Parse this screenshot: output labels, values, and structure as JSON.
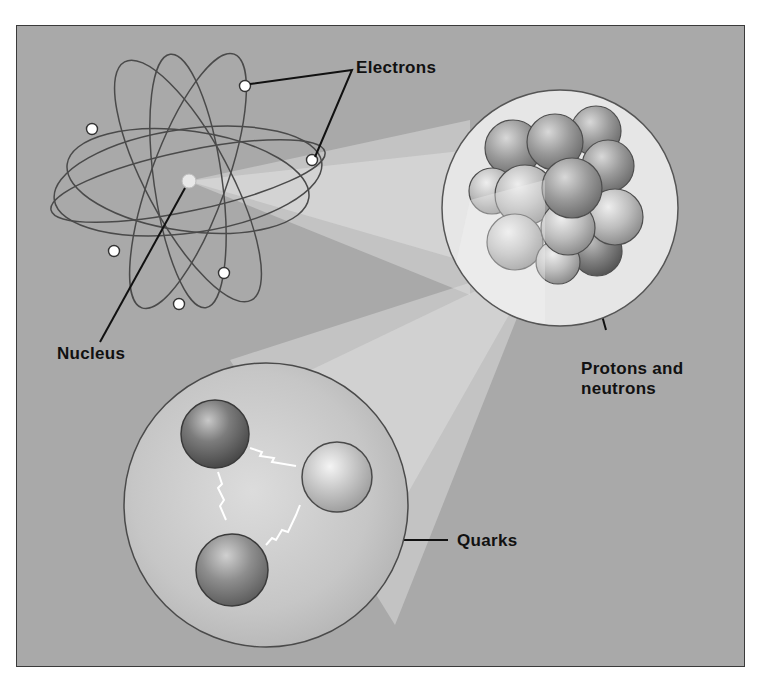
{
  "diagram": {
    "colors": {
      "background": "#a9a9a9",
      "frame": "#3a3a3a",
      "orbit": "#4a4a4a",
      "electron": "#ffffff",
      "beam": "#e4e4e4",
      "nucleus_disc": "#e6e6e6",
      "nucleon_disc": "#c4c4c4",
      "label_text": "#111111"
    },
    "labels": {
      "electrons": "Electrons",
      "nucleus": "Nucleus",
      "protons_neutrons_line1": "Protons and",
      "protons_neutrons_line2": "neutrons",
      "quarks": "Quarks"
    },
    "atom": {
      "center": [
        188,
        181
      ],
      "electron_count": 7,
      "orbit_count": 5
    },
    "nucleus_zoom": {
      "center": [
        560,
        208
      ],
      "radius": 118,
      "nucleon_count": 16
    },
    "nucleon_zoom": {
      "center": [
        266,
        505
      ],
      "radius": 145,
      "quark_count": 3
    }
  }
}
